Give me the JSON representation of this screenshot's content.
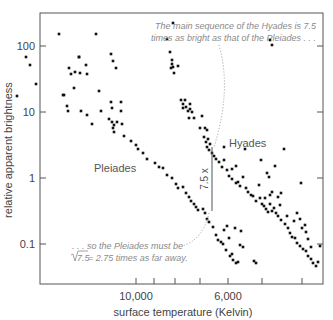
{
  "chart_data": {
    "type": "scatter",
    "title": "",
    "xlabel": "surface temperature (Kelvin)",
    "ylabel": "relative apparent brightness",
    "y_scale": "log",
    "y_ticks": [
      "100",
      "10",
      "1",
      "0.1"
    ],
    "y_tick_values": [
      100,
      10,
      1,
      0.1
    ],
    "ylim": [
      0.02,
      300
    ],
    "x_scale": "reversed (temperature decreases to the right)",
    "x_tick_labels": [
      "10,000",
      "6,000"
    ],
    "x_ticks_minor": 7,
    "grid": false,
    "legend": "none (clusters labeled directly)",
    "cluster_labels": [
      "Pleiades",
      "Hyades"
    ],
    "annotations": {
      "top": [
        "The main sequence of the Hyades is 7.5",
        "times as bright as that of the Pleiades . . ."
      ],
      "bottom_line1": ". . . so the Pleiades must be",
      "bottom_line2_sqrt": "7.5",
      "bottom_line2_rest": " = 2.75 times as far away.",
      "ratio_label": "7.5 x"
    },
    "series": [
      {
        "name": "Pleiades",
        "points_px": [
          [
            17,
            96
          ],
          [
            26,
            57
          ],
          [
            30,
            65
          ],
          [
            36,
            84
          ],
          [
            59,
            34
          ],
          [
            69,
            68
          ],
          [
            71,
            74
          ],
          [
            74,
            88
          ],
          [
            79,
            57
          ],
          [
            80,
            73
          ],
          [
            87,
            74
          ],
          [
            86,
            65
          ],
          [
            75,
            72
          ],
          [
            64,
            95
          ],
          [
            67,
            106
          ],
          [
            68,
            111
          ],
          [
            81,
            111
          ],
          [
            87,
            115
          ],
          [
            92,
            124
          ],
          [
            99,
            91
          ],
          [
            101,
            111
          ],
          [
            109,
            119
          ],
          [
            112,
            122
          ],
          [
            113,
            128
          ],
          [
            114,
            125
          ],
          [
            117,
            122
          ],
          [
            114,
            132
          ],
          [
            122,
            124
          ],
          [
            124,
            136
          ],
          [
            111,
            102
          ],
          [
            121,
            102
          ],
          [
            112,
            108
          ],
          [
            121,
            111
          ],
          [
            116,
            68
          ],
          [
            113,
            61
          ],
          [
            111,
            54
          ],
          [
            96,
            34
          ],
          [
            79,
            57
          ],
          [
            63,
            95
          ],
          [
            131,
            141
          ],
          [
            136,
            145
          ],
          [
            138,
            149
          ],
          [
            143,
            153
          ],
          [
            147,
            159
          ],
          [
            155,
            163
          ],
          [
            159,
            167
          ],
          [
            163,
            168
          ],
          [
            167,
            175
          ],
          [
            172,
            178
          ],
          [
            176,
            184
          ],
          [
            178,
            188
          ],
          [
            183,
            187
          ],
          [
            186,
            193
          ],
          [
            189,
            197
          ],
          [
            191,
            201
          ],
          [
            194,
            204
          ],
          [
            196,
            207
          ],
          [
            198,
            210
          ],
          [
            203,
            209
          ],
          [
            205,
            213
          ],
          [
            207,
            219
          ],
          [
            209,
            222
          ],
          [
            213,
            227
          ],
          [
            216,
            235
          ],
          [
            218,
            240
          ],
          [
            221,
            242
          ],
          [
            223,
            244
          ],
          [
            226,
            250
          ],
          [
            230,
            256
          ],
          [
            233,
            260
          ],
          [
            236,
            263
          ],
          [
            238,
            262
          ],
          [
            240,
            245
          ],
          [
            243,
            247
          ],
          [
            241,
            231
          ],
          [
            235,
            228
          ],
          [
            227,
            226
          ],
          [
            224,
            230
          ],
          [
            229,
            238
          ],
          [
            232,
            254
          ],
          [
            254,
            261
          ],
          [
            256,
            263
          ]
        ]
      },
      {
        "name": "Hyades",
        "points_px": [
          [
            173,
            23
          ],
          [
            170,
            52
          ],
          [
            167,
            39
          ],
          [
            172,
            60
          ],
          [
            172,
            64
          ],
          [
            171,
            68
          ],
          [
            173,
            67
          ],
          [
            174,
            73
          ],
          [
            178,
            66
          ],
          [
            181,
            100
          ],
          [
            185,
            100
          ],
          [
            183,
            104
          ],
          [
            186,
            107
          ],
          [
            183,
            108
          ],
          [
            190,
            104
          ],
          [
            188,
            111
          ],
          [
            190,
            109
          ],
          [
            192,
            112
          ],
          [
            189,
            118
          ],
          [
            194,
            118
          ],
          [
            202,
            116
          ],
          [
            200,
            128
          ],
          [
            205,
            128
          ],
          [
            207,
            130
          ],
          [
            204,
            137
          ],
          [
            206,
            142
          ],
          [
            208,
            139
          ],
          [
            207,
            147
          ],
          [
            209,
            150
          ],
          [
            210,
            144
          ],
          [
            212,
            153
          ],
          [
            214,
            156
          ],
          [
            216,
            159
          ],
          [
            219,
            162
          ],
          [
            224,
            160
          ],
          [
            222,
            167
          ],
          [
            227,
            170
          ],
          [
            229,
            176
          ],
          [
            232,
            179
          ],
          [
            236,
            183
          ],
          [
            240,
            186
          ],
          [
            238,
            182
          ],
          [
            243,
            177
          ],
          [
            246,
            188
          ],
          [
            248,
            192
          ],
          [
            251,
            195
          ],
          [
            253,
            196
          ],
          [
            256,
            201
          ],
          [
            259,
            185
          ],
          [
            260,
            198
          ],
          [
            262,
            204
          ],
          [
            264,
            206
          ],
          [
            266,
            209
          ],
          [
            268,
            212
          ],
          [
            270,
            204
          ],
          [
            272,
            211
          ],
          [
            274,
            208
          ],
          [
            276,
            213
          ],
          [
            278,
            216
          ],
          [
            281,
            220
          ],
          [
            285,
            224
          ],
          [
            288,
            228
          ],
          [
            290,
            233
          ],
          [
            292,
            237
          ],
          [
            295,
            238
          ],
          [
            297,
            243
          ],
          [
            300,
            246
          ],
          [
            303,
            249
          ],
          [
            306,
            251
          ],
          [
            308,
            256
          ],
          [
            311,
            259
          ],
          [
            313,
            263
          ],
          [
            316,
            266
          ],
          [
            318,
            262
          ],
          [
            320,
            246
          ],
          [
            306,
            232
          ],
          [
            302,
            228
          ],
          [
            281,
            193
          ],
          [
            301,
            183
          ],
          [
            308,
            239
          ],
          [
            311,
            247
          ],
          [
            267,
            173
          ],
          [
            269,
            177
          ],
          [
            275,
            166
          ],
          [
            284,
            149
          ],
          [
            270,
            195
          ],
          [
            278,
            197
          ],
          [
            265,
            198
          ],
          [
            261,
            160
          ],
          [
            272,
            192
          ],
          [
            280,
            205
          ],
          [
            287,
            216
          ],
          [
            294,
            221
          ],
          [
            297,
            213
          ],
          [
            300,
            219
          ],
          [
            305,
            225
          ],
          [
            270,
            40
          ],
          [
            272,
            45
          ],
          [
            224,
            147
          ],
          [
            245,
            149
          ],
          [
            232,
            169
          ],
          [
            236,
            166
          ]
        ]
      }
    ]
  }
}
